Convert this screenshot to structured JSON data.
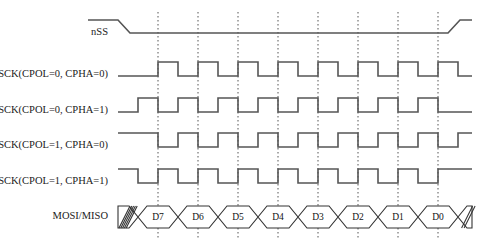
{
  "diagram": {
    "type": "timing-waveform",
    "width": 480,
    "height": 248,
    "background_color": "#ffffff",
    "line_color": "#555555",
    "outline_color": "#333333",
    "text_color": "#1a1a1a"
  },
  "geometry": {
    "label_right_x": 108,
    "wave_start_x": 118,
    "wave_end_x": 472,
    "first_edge_x": 138,
    "bit_width": 40,
    "bit_count": 8,
    "gridline_offset": 20,
    "row_height": 10
  },
  "gridlines": {
    "count": 8,
    "x_positions": [
      158,
      198,
      238,
      278,
      318,
      358,
      398,
      438
    ],
    "y_top": 12,
    "y_bottom": 238,
    "style": "dotted"
  },
  "signals": [
    {
      "id": "nss",
      "label": "nSS",
      "y_high": 20,
      "y_low": 33,
      "kind": "chip-select",
      "active_low": true,
      "fall_start_x": 118,
      "fall_end_x": 130,
      "rise_start_x": 448,
      "rise_end_x": 460,
      "initial_level": "high",
      "final_level": "high"
    },
    {
      "id": "sck-cpol0-cpha0",
      "label": "SCK(CPOL=0, CPHA=0)",
      "cpol": 0,
      "cpha": 0,
      "y_high": 62,
      "y_low": 76,
      "idle_level": "low",
      "first_edge_x": 158,
      "pulse_high_width": 20,
      "pulse_period": 40,
      "pulses": 8,
      "lead_in_from_x": 118,
      "tail_to_x": 472
    },
    {
      "id": "sck-cpol0-cpha1",
      "label": "SCK(CPOL=0, CPHA=1)",
      "cpol": 0,
      "cpha": 1,
      "y_high": 98,
      "y_low": 112,
      "idle_level": "low",
      "first_edge_x": 138,
      "pulse_high_width": 20,
      "pulse_period": 40,
      "pulses": 8,
      "lead_in_from_x": 118,
      "tail_to_x": 472
    },
    {
      "id": "sck-cpol1-cpha0",
      "label": "SCK(CPOL=1, CPHA=0)",
      "cpol": 1,
      "cpha": 0,
      "y_high": 133,
      "y_low": 147,
      "idle_level": "high",
      "first_edge_x": 158,
      "pulse_high_width": 20,
      "pulse_period": 40,
      "pulses": 8,
      "lead_in_from_x": 118,
      "tail_to_x": 472
    },
    {
      "id": "sck-cpol1-cpha1",
      "label": "SCK(CPOL=1, CPHA=1)",
      "cpol": 1,
      "cpha": 1,
      "y_high": 169,
      "y_low": 183,
      "idle_level": "high",
      "first_edge_x": 138,
      "pulse_high_width": 20,
      "pulse_period": 40,
      "pulses": 8,
      "lead_in_from_x": 118,
      "tail_to_x": 472
    }
  ],
  "data_signal": {
    "id": "mosi-miso",
    "label": "MOSI/MISO",
    "y_top": 206,
    "y_bottom": 228,
    "start_x": 118,
    "end_x": 472,
    "bit_start_x": 138,
    "bit_width": 40,
    "transition_width": 9,
    "lead_hatch": {
      "from_x": 118,
      "to_x": 138,
      "stripe_count": 5,
      "style": "diagonal-hatch"
    },
    "trail_hatch": {
      "from_x": 458,
      "to_x": 472,
      "stripe_count": 2,
      "style": "diagonal-hatch"
    },
    "bits": [
      {
        "label": "D7",
        "index": 7
      },
      {
        "label": "D6",
        "index": 6
      },
      {
        "label": "D5",
        "index": 5
      },
      {
        "label": "D4",
        "index": 4
      },
      {
        "label": "D3",
        "index": 3
      },
      {
        "label": "D2",
        "index": 2
      },
      {
        "label": "D1",
        "index": 1
      },
      {
        "label": "D0",
        "index": 0
      }
    ]
  }
}
